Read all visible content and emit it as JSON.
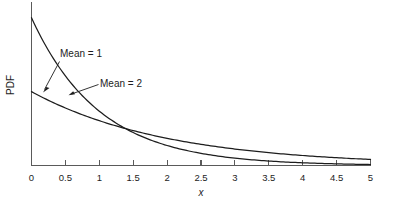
{
  "chart_data": {
    "type": "line",
    "title": "",
    "subtitle": "",
    "xlabel": "x",
    "ylabel": "PDF",
    "xlim": [
      0,
      5
    ],
    "ylim": [
      0,
      1.1
    ],
    "grid": false,
    "legend_position": "none",
    "x_ticks": [
      "0",
      "0.5",
      "1",
      "1.5",
      "2",
      "2.5",
      "3",
      "3.5",
      "4",
      "4.5",
      "5"
    ],
    "x_tick_values": [
      0,
      0.5,
      1,
      1.5,
      2,
      2.5,
      3,
      3.5,
      4,
      4.5,
      5
    ],
    "y_ticks": [],
    "series": [
      {
        "name": "Mean = 1",
        "distribution": "exponential",
        "mean": 1,
        "rate": 1,
        "x": [
          0,
          0.25,
          0.5,
          0.69,
          0.75,
          1,
          1.25,
          1.5,
          1.75,
          2,
          2.5,
          3,
          3.5,
          4,
          4.5,
          5
        ],
        "values": [
          1.0,
          0.779,
          0.607,
          0.5,
          0.472,
          0.368,
          0.287,
          0.223,
          0.174,
          0.135,
          0.082,
          0.05,
          0.03,
          0.018,
          0.011,
          0.0067
        ]
      },
      {
        "name": "Mean = 2",
        "distribution": "exponential",
        "mean": 2,
        "rate": 0.5,
        "x": [
          0,
          0.25,
          0.5,
          0.69,
          0.75,
          1,
          1.25,
          1.5,
          1.75,
          2,
          2.5,
          3,
          3.5,
          4,
          4.5,
          5
        ],
        "values": [
          0.5,
          0.441,
          0.389,
          0.354,
          0.344,
          0.303,
          0.268,
          0.236,
          0.208,
          0.184,
          0.143,
          0.112,
          0.087,
          0.068,
          0.053,
          0.041
        ]
      }
    ],
    "annotations": [
      {
        "text": "Mean = 1",
        "target_x": 0.25,
        "target_y": 0.779,
        "label_x": 0.62,
        "label_y": 0.92
      },
      {
        "text": "Mean = 2",
        "target_x": 0.52,
        "target_y": 0.385,
        "label_x": 1.18,
        "label_y": 0.62
      }
    ]
  },
  "ticks": {
    "t0": "0",
    "t1": "0.5",
    "t2": "1",
    "t3": "1.5",
    "t4": "2",
    "t5": "2.5",
    "t6": "3",
    "t7": "3.5",
    "t8": "4",
    "t9": "4.5",
    "t10": "5"
  },
  "labels": {
    "x_axis_title": "x",
    "y_axis_title": "PDF",
    "annotation_one": "Mean = 1",
    "annotation_two": "Mean = 2"
  },
  "colors": {
    "curve": "#1d1d1d",
    "axis": "#5a5a5a",
    "background": "#ffffff",
    "text": "#1d1d1d"
  }
}
